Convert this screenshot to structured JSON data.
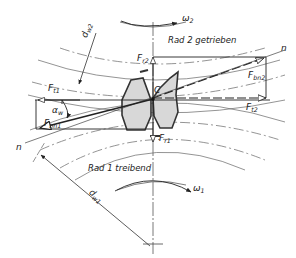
{
  "diagram": {
    "colors": {
      "line": "#333333",
      "thin_line": "#555555",
      "tooth_fill": "#d8d8d8",
      "tooth_outline": "#333333",
      "background": "#ffffff"
    },
    "gears": [
      {
        "id": "rad1",
        "label": "Rad 1 treibend",
        "omega": "ω",
        "omega_sub": "1",
        "pitch_diameter": "d",
        "pitch_diameter_sub": "w1"
      },
      {
        "id": "rad2",
        "label": "Rad 2 getrieben",
        "omega": "ω",
        "omega_sub": "2",
        "pitch_diameter": "d",
        "pitch_diameter_sub": "w2"
      }
    ],
    "forces": {
      "Fr2": {
        "main": "F",
        "sub": "r2"
      },
      "Fr1": {
        "main": "F",
        "sub": "r1"
      },
      "Ft1": {
        "main": "F",
        "sub": "t1"
      },
      "Ft2": {
        "main": "F",
        "sub": "t2"
      },
      "Fbn1": {
        "main": "F",
        "sub": "bn1"
      },
      "Fbn2": {
        "main": "F",
        "sub": "bn2"
      }
    },
    "pitch_point": "C",
    "line_of_action": "n",
    "pressure_angle": {
      "main": "α",
      "sub": "w"
    }
  }
}
